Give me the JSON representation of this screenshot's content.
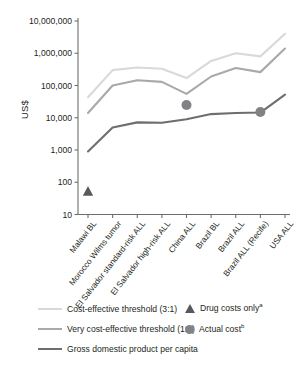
{
  "chart_data": {
    "type": "line",
    "title": "",
    "xlabel": "",
    "ylabel": "US$",
    "yscale": "log",
    "ylim": [
      10,
      10000000
    ],
    "ytick_labels": [
      "10,000,000",
      "1,000,000",
      "100,000",
      "10,000",
      "1,000",
      "100",
      "10"
    ],
    "ytick_values": [
      10000000,
      1000000,
      100000,
      10000,
      1000,
      100,
      10
    ],
    "grid": false,
    "legend_position": "bottom",
    "categories": [
      "Malawi BL",
      "Morocco Wilms tumor",
      "El Salvador standard-risk ALL",
      "El Salvador high-risk ALL",
      "China ALL",
      "Brazil BL",
      "Brazil ALL",
      "Brazil ALL (Recife)",
      "USA ALL"
    ],
    "series": [
      {
        "name": "Cost-effective threshold (3:1)",
        "color": "#d9d9d9",
        "values": [
          43000,
          300000,
          360000,
          330000,
          170000,
          580000,
          1000000,
          800000,
          4000000
        ]
      },
      {
        "name": "Very cost-effective threshold (1:1)",
        "color": "#a7a9ac",
        "values": [
          14000,
          100000,
          145000,
          130000,
          55000,
          190000,
          350000,
          260000,
          1400000
        ]
      },
      {
        "name": "Gross domestic product per capita",
        "color": "#6d6e71",
        "values": [
          900,
          5000,
          7200,
          7000,
          9000,
          13000,
          14000,
          14500,
          52000
        ]
      }
    ],
    "markers": [
      {
        "name": "Drug costs only",
        "shape": "triangle",
        "color": "#58595b",
        "points": [
          {
            "category": "Malawi BL",
            "value": 50
          }
        ]
      },
      {
        "name": "Actual cost",
        "shape": "circle",
        "color": "#808285",
        "points": [
          {
            "category": "China ALL",
            "value": 25000
          },
          {
            "category": "Brazil ALL (Recife)",
            "value": 15000
          }
        ]
      }
    ],
    "legend_entries": [
      {
        "label": "Cost-effective threshold (3:1)",
        "type": "line",
        "color": "#d9d9d9"
      },
      {
        "label": "Very cost-effective threshold (1:1)",
        "type": "line",
        "color": "#a7a9ac"
      },
      {
        "label": "Gross domestic product per capita",
        "type": "line",
        "color": "#6d6e71"
      },
      {
        "label": "Drug costs only",
        "superscript": "a",
        "type": "triangle",
        "color": "#58595b"
      },
      {
        "label": "Actual cost",
        "superscript": "b",
        "type": "circle",
        "color": "#808285"
      }
    ]
  },
  "axis": {
    "y_title": "US$"
  },
  "legend": {
    "cost_effective_3_1": "Cost-effective threshold (3:1)",
    "very_cost_effective_1_1": "Very cost-effective threshold (1:1)",
    "gdp_per_capita": "Gross domestic product per capita",
    "drug_costs_only": "Drug costs only",
    "drug_costs_only_sup": "a",
    "actual_cost": "Actual cost",
    "actual_cost_sup": "b"
  }
}
